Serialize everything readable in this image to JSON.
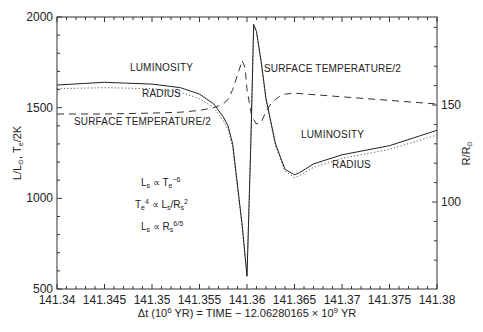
{
  "chart_data": {
    "type": "line",
    "title": "",
    "xlabel": "Δt (10^6 YR) = TIME − 12.06280165 × 10^9 YR",
    "xlabel_parts": {
      "pre": "Δt (10",
      "sup1": "6",
      "mid": " YR) = TIME − 12.06280165 × 10",
      "sup2": "9",
      "post": " YR"
    },
    "ylabel_left": "L/L⊙, Te/2K",
    "ylabel_left_parts": {
      "a": "L/L",
      "a_sub": "⊙",
      "b": ", T",
      "b_sub": "e",
      "c": "/2K"
    },
    "ylabel_right": "R/R⊙",
    "ylabel_right_parts": {
      "a": "R/R",
      "a_sub": "⊙"
    },
    "xlim": [
      141.34,
      141.38
    ],
    "ylim_left": [
      500,
      2000
    ],
    "ylim_right_ticks": [
      100,
      150
    ],
    "x_ticks": [
      "141.34",
      "141.345",
      "141.35",
      "141.355",
      "141.36",
      "141.365",
      "141.37",
      "141.375",
      "141.38"
    ],
    "y_ticks_left": [
      "2000",
      "1500",
      "1000",
      "500"
    ],
    "y_ticks_right": [
      "150",
      "100"
    ],
    "grid": false,
    "series": [
      {
        "name": "LUMINOSITY",
        "style": "solid",
        "axis": "left",
        "x": [
          141.34,
          141.345,
          141.35,
          141.353,
          141.355,
          141.3565,
          141.3575,
          141.358,
          141.3585,
          141.3595,
          141.36,
          141.3604,
          141.3607,
          141.361,
          141.3615,
          141.362,
          141.363,
          141.364,
          141.365,
          141.3655,
          141.367,
          141.37,
          141.375,
          141.38
        ],
        "values": [
          1625,
          1640,
          1630,
          1610,
          1575,
          1520,
          1450,
          1400,
          1300,
          850,
          570,
          1300,
          1960,
          1920,
          1750,
          1550,
          1300,
          1160,
          1130,
          1140,
          1190,
          1240,
          1290,
          1375
        ]
      },
      {
        "name": "RADIUS",
        "style": "dotted",
        "axis": "right",
        "x": [
          141.34,
          141.345,
          141.35,
          141.353,
          141.355,
          141.3565,
          141.3575,
          141.358,
          141.3585,
          141.3595,
          141.36,
          141.3604,
          141.3607,
          141.361,
          141.3615,
          141.362,
          141.363,
          141.364,
          141.365,
          141.3655,
          141.367,
          141.37,
          141.375,
          141.38
        ],
        "values_in_left_units": [
          1605,
          1610,
          1605,
          1585,
          1550,
          1500,
          1430,
          1380,
          1280,
          840,
          580,
          1290,
          1950,
          1915,
          1740,
          1540,
          1290,
          1150,
          1115,
          1125,
          1170,
          1220,
          1270,
          1350
        ]
      },
      {
        "name": "SURFACE TEMPERATURE/2",
        "style": "dashed",
        "axis": "left",
        "x": [
          141.34,
          141.345,
          141.35,
          141.353,
          141.355,
          141.3565,
          141.3575,
          141.358,
          141.3585,
          141.359,
          141.3595,
          141.3598,
          141.36,
          141.3605,
          141.361,
          141.3615,
          141.362,
          141.3625,
          141.363,
          141.3635,
          141.364,
          141.365,
          141.37,
          141.375,
          141.38
        ],
        "values": [
          1465,
          1465,
          1470,
          1475,
          1485,
          1500,
          1520,
          1545,
          1600,
          1680,
          1760,
          1720,
          1600,
          1450,
          1410,
          1420,
          1480,
          1520,
          1545,
          1565,
          1575,
          1580,
          1560,
          1540,
          1520
        ]
      }
    ],
    "annotations": [
      {
        "text": "LUMINOSITY",
        "x": 141.351,
        "y": 1700
      },
      {
        "text": "RADIUS",
        "x": 141.351,
        "y": 1560
      },
      {
        "text": "SURFACE TEMPERATURE/2",
        "x": 141.349,
        "y": 1405
      },
      {
        "text": "SURFACE TEMPERATURE/2",
        "x": 141.369,
        "y": 1695
      },
      {
        "text": "LUMINOSITY",
        "x": 141.369,
        "y": 1335
      },
      {
        "text": "RADIUS",
        "x": 141.371,
        "y": 1170
      }
    ],
    "equations": [
      {
        "base": "L",
        "sub": "s",
        "op": " ∝ T",
        "sub2": "e",
        "sup": "−6",
        "rest": ""
      },
      {
        "base": "T",
        "sub": "e",
        "sup0": "4",
        "op": " ∝ L",
        "sub2": "s",
        "rest": "/R",
        "sub3": "s",
        "sup": "2"
      },
      {
        "base": "L",
        "sub": "s",
        "op": " ∝ R",
        "sub2": "s",
        "sup": "6/5",
        "rest": ""
      }
    ]
  }
}
